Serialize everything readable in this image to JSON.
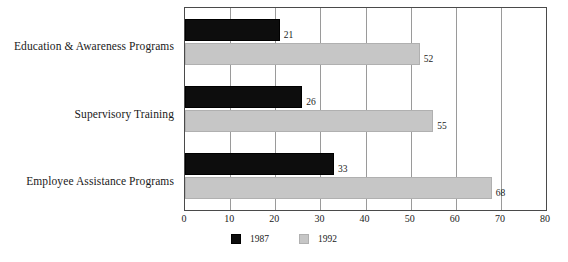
{
  "chart_data": {
    "type": "bar",
    "orientation": "horizontal",
    "title": "",
    "xlabel": "",
    "ylabel": "",
    "categories": [
      "Education & Awareness Programs",
      "Supervisory Training",
      "Employee Assistance Programs"
    ],
    "series": [
      {
        "name": "1987",
        "color": "#0d0d0d",
        "values": [
          21,
          26,
          33
        ]
      },
      {
        "name": "1992",
        "color": "#c6c6c6",
        "values": [
          52,
          55,
          68
        ]
      }
    ],
    "xlim": [
      0,
      80
    ],
    "xticks": [
      0,
      10,
      20,
      30,
      40,
      50,
      60,
      70,
      80
    ],
    "grid": true,
    "grid_axis": "x",
    "legend_position": "bottom-center",
    "value_labels": true
  },
  "legend": {
    "items": [
      {
        "label": "1987",
        "color": "#0d0d0d"
      },
      {
        "label": "1992",
        "color": "#c6c6c6"
      }
    ]
  },
  "colors": {
    "series_1987": "#0d0d0d",
    "series_1992": "#c6c6c6",
    "frame": "#4a4a4a",
    "gridline": "#9a9a9a",
    "text": "#1a1a1a",
    "background": "#ffffff"
  }
}
